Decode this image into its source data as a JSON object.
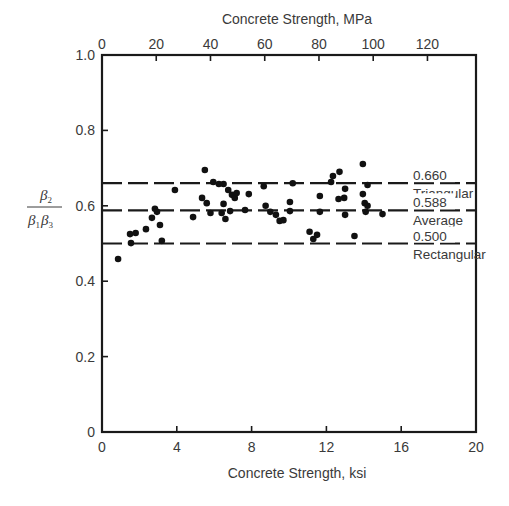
{
  "chart_data": {
    "type": "scatter",
    "title": "",
    "xlabel": "Concrete Strength, ksi",
    "x2label": "Concrete Strength, MPa",
    "ylabel": "β2 / (β1 β3)",
    "ylabel_numerator": "β2",
    "ylabel_denominator": "β1β3",
    "xlim": [
      0,
      20
    ],
    "x2lim": [
      0,
      137.9
    ],
    "ylim": [
      0,
      1.0
    ],
    "xticks": [
      0,
      4,
      8,
      12,
      16,
      20
    ],
    "x2ticks": [
      0,
      20,
      40,
      60,
      80,
      100,
      120
    ],
    "yticks": [
      0,
      0.2,
      0.4,
      0.6,
      0.8,
      1.0
    ],
    "ytick_labels": [
      "0",
      "0.2",
      "0.4",
      "0.6",
      "0.8",
      "1.0"
    ],
    "grid": false,
    "reference_lines": [
      {
        "value": 0.66,
        "label": "0.660",
        "name": "Triangular",
        "style": "dashed"
      },
      {
        "value": 0.588,
        "label": "0.588",
        "name": "Average",
        "style": "dashed"
      },
      {
        "value": 0.5,
        "label": "0.500",
        "name": "Rectangular",
        "style": "dashed"
      }
    ],
    "series": [
      {
        "name": "Test data",
        "points": [
          [
            0.86,
            0.459
          ],
          [
            1.55,
            0.501
          ],
          [
            1.5,
            0.525
          ],
          [
            1.8,
            0.528
          ],
          [
            2.35,
            0.538
          ],
          [
            2.67,
            0.568
          ],
          [
            2.94,
            0.584
          ],
          [
            2.83,
            0.592
          ],
          [
            3.1,
            0.549
          ],
          [
            3.2,
            0.507
          ],
          [
            3.9,
            0.642
          ],
          [
            4.87,
            0.57
          ],
          [
            5.5,
            0.695
          ],
          [
            5.35,
            0.621
          ],
          [
            5.6,
            0.607
          ],
          [
            5.8,
            0.581
          ],
          [
            5.95,
            0.663
          ],
          [
            6.25,
            0.658
          ],
          [
            6.5,
            0.658
          ],
          [
            6.5,
            0.605
          ],
          [
            6.4,
            0.581
          ],
          [
            6.75,
            0.642
          ],
          [
            6.95,
            0.629
          ],
          [
            7.1,
            0.621
          ],
          [
            7.2,
            0.634
          ],
          [
            6.6,
            0.565
          ],
          [
            6.85,
            0.586
          ],
          [
            7.85,
            0.631
          ],
          [
            7.65,
            0.589
          ],
          [
            8.65,
            0.652
          ],
          [
            8.75,
            0.6
          ],
          [
            9.0,
            0.584
          ],
          [
            9.3,
            0.576
          ],
          [
            9.5,
            0.56
          ],
          [
            9.7,
            0.562
          ],
          [
            10.05,
            0.586
          ],
          [
            10.05,
            0.61
          ],
          [
            10.2,
            0.66
          ],
          [
            11.1,
            0.531
          ],
          [
            11.3,
            0.512
          ],
          [
            11.5,
            0.523
          ],
          [
            11.65,
            0.584
          ],
          [
            11.65,
            0.626
          ],
          [
            12.25,
            0.663
          ],
          [
            12.35,
            0.679
          ],
          [
            12.7,
            0.69
          ],
          [
            12.65,
            0.618
          ],
          [
            12.95,
            0.621
          ],
          [
            13.0,
            0.576
          ],
          [
            13.0,
            0.645
          ],
          [
            13.5,
            0.52
          ],
          [
            13.95,
            0.711
          ],
          [
            13.95,
            0.631
          ],
          [
            14.05,
            0.607
          ],
          [
            14.2,
            0.6
          ],
          [
            14.2,
            0.655
          ],
          [
            14.1,
            0.584
          ],
          [
            15.0,
            0.578
          ]
        ]
      }
    ],
    "legend": null
  }
}
